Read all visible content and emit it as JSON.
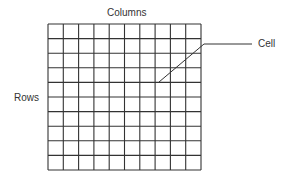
{
  "diagram": {
    "labels": {
      "columns": "Columns",
      "rows": "Rows",
      "cell": "Cell"
    },
    "grid": {
      "rows": 10,
      "columns": 10,
      "line_color": "#333333"
    },
    "callout": {
      "target": "Cell",
      "line_color": "#333333"
    }
  }
}
